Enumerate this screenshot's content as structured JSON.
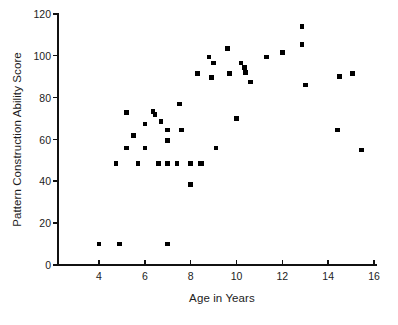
{
  "chart_data": {
    "type": "scatter",
    "title": "",
    "xlabel": "Age in Years",
    "ylabel": "Pattern Construction Ability Score",
    "xlim": [
      3.0,
      16.0
    ],
    "ylim": [
      0,
      120
    ],
    "xticks": [
      4,
      6,
      8,
      10,
      12,
      14,
      16
    ],
    "xtick_labels": [
      "4",
      "6",
      "8",
      "10",
      "12",
      "14",
      "16"
    ],
    "yticks": [
      0,
      20,
      40,
      60,
      80,
      100,
      120
    ],
    "ytick_labels": [
      "0",
      "20",
      "40",
      "60",
      "80",
      "100",
      "120"
    ],
    "grid": false,
    "legend": null,
    "marker": "square",
    "marker_color": "#000000",
    "points": [
      {
        "x": 4.0,
        "y": 10
      },
      {
        "x": 4.9,
        "y": 10
      },
      {
        "x": 7.0,
        "y": 10
      },
      {
        "x": 4.75,
        "y": 48.5
      },
      {
        "x": 5.2,
        "y": 73
      },
      {
        "x": 5.2,
        "y": 56
      },
      {
        "x": 5.5,
        "y": 62
      },
      {
        "x": 5.7,
        "y": 48.5
      },
      {
        "x": 6.0,
        "y": 67.5
      },
      {
        "x": 6.0,
        "y": 56
      },
      {
        "x": 6.35,
        "y": 73.5
      },
      {
        "x": 6.45,
        "y": 72
      },
      {
        "x": 6.6,
        "y": 48.5
      },
      {
        "x": 6.7,
        "y": 68.5
      },
      {
        "x": 7.0,
        "y": 48.5
      },
      {
        "x": 7.0,
        "y": 64.5
      },
      {
        "x": 7.0,
        "y": 59.5
      },
      {
        "x": 7.4,
        "y": 48.5
      },
      {
        "x": 7.5,
        "y": 77
      },
      {
        "x": 7.6,
        "y": 64.5
      },
      {
        "x": 8.0,
        "y": 38.5
      },
      {
        "x": 8.0,
        "y": 48.5
      },
      {
        "x": 8.4,
        "y": 48.5
      },
      {
        "x": 8.5,
        "y": 48.5
      },
      {
        "x": 8.3,
        "y": 91.5
      },
      {
        "x": 8.8,
        "y": 99.5
      },
      {
        "x": 8.9,
        "y": 89.5
      },
      {
        "x": 9.0,
        "y": 96.5
      },
      {
        "x": 9.1,
        "y": 56
      },
      {
        "x": 9.6,
        "y": 103.5
      },
      {
        "x": 9.7,
        "y": 91.5
      },
      {
        "x": 10.0,
        "y": 70
      },
      {
        "x": 10.2,
        "y": 96.5
      },
      {
        "x": 10.35,
        "y": 94.5
      },
      {
        "x": 10.4,
        "y": 92
      },
      {
        "x": 10.6,
        "y": 87.5
      },
      {
        "x": 11.3,
        "y": 99.5
      },
      {
        "x": 12.0,
        "y": 101.5
      },
      {
        "x": 12.85,
        "y": 114
      },
      {
        "x": 12.85,
        "y": 105.5
      },
      {
        "x": 13.0,
        "y": 86
      },
      {
        "x": 14.4,
        "y": 64.5
      },
      {
        "x": 14.5,
        "y": 90
      },
      {
        "x": 15.05,
        "y": 91.5
      },
      {
        "x": 15.45,
        "y": 55
      }
    ]
  }
}
